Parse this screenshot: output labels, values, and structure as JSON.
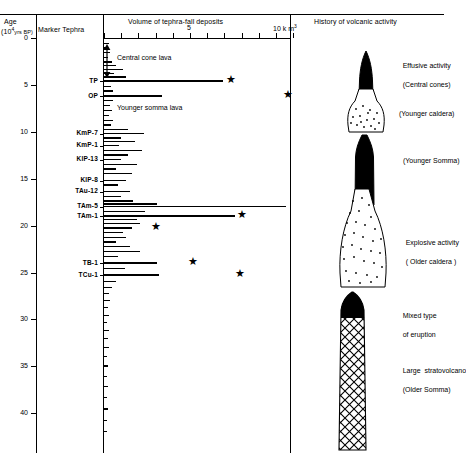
{
  "figure": {
    "columns": {
      "age_header_line1": "Age",
      "age_header_line2": "(10",
      "age_header_exp": "4",
      "age_header_unit": "yrs BP)",
      "marker_header": "Marker Tephra",
      "volume_header": "Volume of tephra-fall deposits",
      "history_header": "History of volcanic activity"
    },
    "age_axis": {
      "ticks": [
        0,
        5,
        10,
        15,
        20,
        25,
        30,
        35,
        40
      ],
      "unit": "10^4 yrs BP",
      "min": 0,
      "max": 44
    },
    "volume_axis": {
      "labeled_ticks": [
        {
          "value": 5,
          "label": "5"
        },
        {
          "value": 10,
          "label": "10 k m"
        }
      ],
      "exponent": "3",
      "unit": "km3",
      "min": 0,
      "max": 11,
      "minor_tick_step": 1
    },
    "annotations": [
      {
        "id": "central-cone-lava",
        "text": "Central cone lava"
      },
      {
        "id": "younger-somma-lava",
        "text": "Younger somma lava"
      }
    ],
    "marker_tephra": [
      {
        "name": "TP",
        "age": 4.6
      },
      {
        "name": "OP",
        "age": 6.2
      },
      {
        "name": "KmP-7",
        "age": 10.2
      },
      {
        "name": "KmP-1",
        "age": 11.5
      },
      {
        "name": "KlP-13",
        "age": 13.0
      },
      {
        "name": "KlP-8",
        "age": 15.2
      },
      {
        "name": "TAu-12",
        "age": 16.4
      },
      {
        "name": "TAm-5",
        "age": 18.0
      },
      {
        "name": "TAm-1",
        "age": 19.0
      },
      {
        "name": "TB-1",
        "age": 24.0
      },
      {
        "name": "TCu-1",
        "age": 25.3
      }
    ],
    "history": [
      {
        "id": "effusive-activity",
        "line1": "Effusive activity",
        "line2": "(Central cones)"
      },
      {
        "id": "younger-caldera",
        "line1": "(Younger caldera)",
        "line2": ""
      },
      {
        "id": "younger-somma",
        "line1": "(Younger Somma)",
        "line2": ""
      },
      {
        "id": "explosive-activity",
        "line1": "Explosive activity",
        "line2": "( Older caldera )"
      },
      {
        "id": "mixed-type",
        "line1": "Mixed type",
        "line2": "of eruption"
      },
      {
        "id": "large-stratovolcano",
        "line1": "Large  stratovolcano",
        "line2": "(Older Somma)"
      }
    ]
  },
  "chart_data": {
    "type": "bar",
    "title": "Volume of tephra-fall deposits",
    "subtitle": "History of volcanic activity",
    "orientation": "horizontal",
    "xlabel": "Volume of tephra-fall deposits (km3)",
    "ylabel": "Age (10^4 yrs BP)",
    "xlim": [
      0,
      11
    ],
    "ylim": [
      44,
      0
    ],
    "grid": false,
    "legend": "none",
    "bars": [
      {
        "age": 0.6,
        "volume": 0.3
      },
      {
        "age": 1.1,
        "volume": 0.2
      },
      {
        "age": 1.6,
        "volume": 0.35
      },
      {
        "age": 2.1,
        "volume": 0.25
      },
      {
        "age": 2.6,
        "volume": 0.45
      },
      {
        "age": 3.0,
        "volume": 0.7
      },
      {
        "age": 3.4,
        "volume": 1.1
      },
      {
        "age": 3.8,
        "volume": 0.6
      },
      {
        "age": 4.2,
        "volume": 1.3
      },
      {
        "age": 4.6,
        "volume": 6.9,
        "tephra": "TP",
        "star": 7.4
      },
      {
        "age": 5.2,
        "volume": 0.4
      },
      {
        "age": 5.7,
        "volume": 0.55
      },
      {
        "age": 6.2,
        "volume": 3.4,
        "tephra": "OP",
        "star": 10.7
      },
      {
        "age": 6.7,
        "volume": 0.5
      },
      {
        "age": 7.2,
        "volume": 0.35
      },
      {
        "age": 7.8,
        "volume": 0.45
      },
      {
        "age": 8.3,
        "volume": 0.3
      },
      {
        "age": 8.8,
        "volume": 0.55
      },
      {
        "age": 9.3,
        "volume": 0.4
      },
      {
        "age": 9.8,
        "volume": 1.4
      },
      {
        "age": 10.2,
        "volume": 2.3,
        "tephra": "KmP-7"
      },
      {
        "age": 10.7,
        "volume": 1.0
      },
      {
        "age": 11.1,
        "volume": 1.8
      },
      {
        "age": 11.5,
        "volume": 0.9,
        "tephra": "KmP-1"
      },
      {
        "age": 12.0,
        "volume": 2.2
      },
      {
        "age": 12.5,
        "volume": 1.4
      },
      {
        "age": 13.0,
        "volume": 1.0,
        "tephra": "KlP-13"
      },
      {
        "age": 13.5,
        "volume": 1.9
      },
      {
        "age": 14.0,
        "volume": 0.7
      },
      {
        "age": 14.5,
        "volume": 1.6
      },
      {
        "age": 15.2,
        "volume": 1.3,
        "tephra": "KlP-8"
      },
      {
        "age": 15.7,
        "volume": 0.8
      },
      {
        "age": 16.4,
        "volume": 1.5,
        "tephra": "TAu-12"
      },
      {
        "age": 16.9,
        "volume": 1.0
      },
      {
        "age": 17.4,
        "volume": 1.7
      },
      {
        "age": 17.7,
        "volume": 3.1
      },
      {
        "age": 18.0,
        "volume": 10.6,
        "tephra": "TAm-5"
      },
      {
        "age": 18.5,
        "volume": 2.4
      },
      {
        "age": 19.0,
        "volume": 7.6,
        "tephra": "TAm-1",
        "star": 8.0
      },
      {
        "age": 19.4,
        "volume": 1.9
      },
      {
        "age": 19.8,
        "volume": 2.1
      },
      {
        "age": 20.3,
        "volume": 1.6,
        "star": 3.0
      },
      {
        "age": 20.8,
        "volume": 1.1
      },
      {
        "age": 21.3,
        "volume": 1.3
      },
      {
        "age": 21.8,
        "volume": 0.7
      },
      {
        "age": 22.3,
        "volume": 1.5
      },
      {
        "age": 22.8,
        "volume": 2.1
      },
      {
        "age": 23.3,
        "volume": 0.8
      },
      {
        "age": 24.0,
        "volume": 3.1,
        "tephra": "TB-1",
        "star": 5.2
      },
      {
        "age": 24.6,
        "volume": 1.2
      },
      {
        "age": 25.3,
        "volume": 3.2,
        "tephra": "TCu-1",
        "star": 7.9
      },
      {
        "age": 26.0,
        "volume": 0.7
      },
      {
        "age": 26.6,
        "volume": 0.45
      },
      {
        "age": 27.3,
        "volume": 0.3
      },
      {
        "age": 28.0,
        "volume": 0.35
      },
      {
        "age": 28.8,
        "volume": 0.25
      },
      {
        "age": 29.6,
        "volume": 0.3
      },
      {
        "age": 30.4,
        "volume": 0.2
      },
      {
        "age": 31.2,
        "volume": 0.28
      },
      {
        "age": 32.1,
        "volume": 0.22
      },
      {
        "age": 33.0,
        "volume": 0.3
      },
      {
        "age": 34.0,
        "volume": 0.18
      },
      {
        "age": 35.0,
        "volume": 0.24
      },
      {
        "age": 36.1,
        "volume": 0.2
      },
      {
        "age": 37.2,
        "volume": 0.26
      },
      {
        "age": 38.4,
        "volume": 0.18
      },
      {
        "age": 39.6,
        "volume": 0.22
      },
      {
        "age": 40.8,
        "volume": 0.16
      },
      {
        "age": 42.0,
        "volume": 0.2
      }
    ],
    "stars_note": "filled five-pointed stars mark eruption volume maxima",
    "dashed_bar_age": 18.6
  }
}
